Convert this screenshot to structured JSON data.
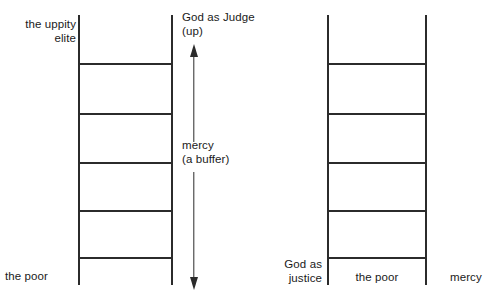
{
  "diagram": {
    "line_color": "#2b2b2b",
    "background": "#ffffff",
    "text_color": "#1a1a1a"
  },
  "left_ladder": {
    "name": "left-ladder",
    "rungs": 5,
    "top_left_label": "the uppity\nelite",
    "bottom_left_label": "the poor"
  },
  "right_ladder": {
    "name": "right-ladder",
    "rungs": 5,
    "bottom_left_label": "God as\njustice",
    "bottom_center_label": "the poor",
    "bottom_right_label": "mercy"
  },
  "axis": {
    "top_label": "God as Judge\n(up)",
    "middle_label": "mercy\n(a buffer)",
    "arrow": "double-headed-vertical-arrow"
  }
}
